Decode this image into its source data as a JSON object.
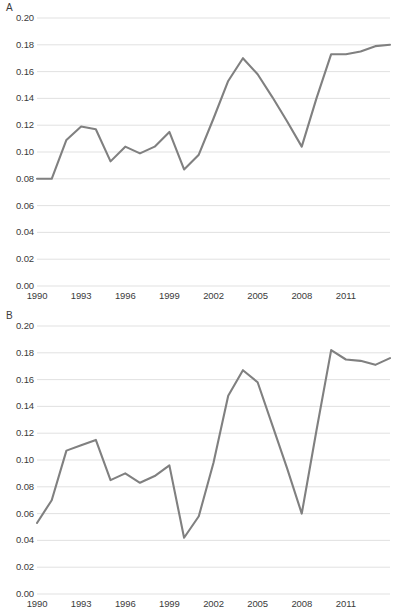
{
  "figure": {
    "background_color": "#ffffff",
    "line_color": "#808080",
    "grid_color": "#d9d9d9",
    "text_color": "#3b3b3b"
  },
  "panels": [
    {
      "letter": "A"
    },
    {
      "letter": "B"
    }
  ],
  "axis": {
    "y_ticks": [
      "0.20",
      "0.18",
      "0.16",
      "0.14",
      "0.12",
      "0.10",
      "0.08",
      "0.06",
      "0.04",
      "0.02",
      "0.00"
    ],
    "x_ticks": [
      "1990",
      "1993",
      "1996",
      "1999",
      "2002",
      "2005",
      "2008",
      "2011"
    ]
  },
  "chart_data": [
    {
      "type": "line",
      "title": "A",
      "xlabel": "",
      "ylabel": "",
      "xlim": [
        1990,
        2014
      ],
      "ylim": [
        0.0,
        0.2
      ],
      "grid": true,
      "legend": "none",
      "x": [
        1990,
        1991,
        1992,
        1993,
        1994,
        1995,
        1996,
        1997,
        1998,
        1999,
        2000,
        2001,
        2002,
        2003,
        2004,
        2005,
        2006,
        2007,
        2008,
        2009,
        2010,
        2011,
        2012,
        2013,
        2014
      ],
      "values": [
        0.08,
        0.08,
        0.109,
        0.119,
        0.117,
        0.093,
        0.104,
        0.099,
        0.104,
        0.115,
        0.087,
        0.098,
        0.125,
        0.153,
        0.17,
        0.158,
        0.141,
        0.123,
        0.104,
        0.14,
        0.173,
        0.173,
        0.175,
        0.179,
        0.18
      ],
      "y_ticks": [
        0.0,
        0.02,
        0.04,
        0.06,
        0.08,
        0.1,
        0.12,
        0.14,
        0.16,
        0.18,
        0.2
      ],
      "x_ticks": [
        1990,
        1993,
        1996,
        1999,
        2002,
        2005,
        2008,
        2011
      ]
    },
    {
      "type": "line",
      "title": "B",
      "xlabel": "",
      "ylabel": "",
      "xlim": [
        1990,
        2014
      ],
      "ylim": [
        0.0,
        0.2
      ],
      "grid": true,
      "legend": "none",
      "x": [
        1990,
        1991,
        1992,
        1993,
        1994,
        1995,
        1996,
        1997,
        1998,
        1999,
        2000,
        2001,
        2002,
        2003,
        2004,
        2005,
        2006,
        2007,
        2008,
        2009,
        2010,
        2011,
        2012,
        2013,
        2014
      ],
      "values": [
        0.053,
        0.07,
        0.107,
        0.111,
        0.115,
        0.085,
        0.09,
        0.083,
        0.088,
        0.096,
        0.042,
        0.058,
        0.098,
        0.148,
        0.167,
        0.158,
        0.126,
        0.094,
        0.06,
        0.122,
        0.182,
        0.175,
        0.174,
        0.171,
        0.176
      ],
      "y_ticks": [
        0.0,
        0.02,
        0.04,
        0.06,
        0.08,
        0.1,
        0.12,
        0.14,
        0.16,
        0.18,
        0.2
      ],
      "x_ticks": [
        1990,
        1993,
        1996,
        1999,
        2002,
        2005,
        2008,
        2011
      ]
    }
  ]
}
